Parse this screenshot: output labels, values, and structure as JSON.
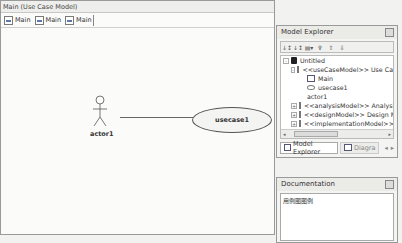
{
  "editor": {
    "title": "Main (Use Case Model)",
    "tabs": [
      {
        "label": "Main"
      },
      {
        "label": "Main"
      },
      {
        "label": "Main"
      }
    ]
  },
  "diagram": {
    "actor": {
      "label": "actor1"
    },
    "usecase": {
      "label": "usecase1"
    }
  },
  "model_explorer": {
    "title": "Model Explorer",
    "toolbar": [
      "sort-az",
      "sort-type",
      "add-dropdown",
      "filter",
      "move-up",
      "move-down"
    ],
    "tree": [
      {
        "label": "Untitled",
        "level": 0,
        "expander": "-",
        "icon": "root"
      },
      {
        "label": "<<useCaseModel>> Use Ca",
        "level": 1,
        "expander": "-",
        "icon": "pkg"
      },
      {
        "label": "Main",
        "level": 2,
        "expander": "",
        "icon": "diag"
      },
      {
        "label": "usecase1",
        "level": 2,
        "expander": "",
        "icon": "uc"
      },
      {
        "label": "actor1",
        "level": 2,
        "expander": "",
        "icon": "actor"
      },
      {
        "label": "<<analysisModel>> Analysi",
        "level": 1,
        "expander": "+",
        "icon": "pkg"
      },
      {
        "label": "<<designModel>> Design M",
        "level": 1,
        "expander": "+",
        "icon": "pkg"
      },
      {
        "label": "<<implementationModel>>",
        "level": 1,
        "expander": "+",
        "icon": "pkg"
      },
      {
        "label": "<<deploymentModel>> Dep",
        "level": 1,
        "expander": "+",
        "icon": "pkg"
      }
    ],
    "scroll": {
      "left": "◂",
      "grip": "III",
      "right": "▸"
    },
    "bottom_tabs": [
      {
        "label": "Model Explorer",
        "active": true
      },
      {
        "label": "Diagra",
        "active": false
      }
    ],
    "tab_nav": {
      "left": "◂",
      "right": "▸"
    }
  },
  "documentation": {
    "title": "Documentation",
    "text": "用例图图例"
  }
}
